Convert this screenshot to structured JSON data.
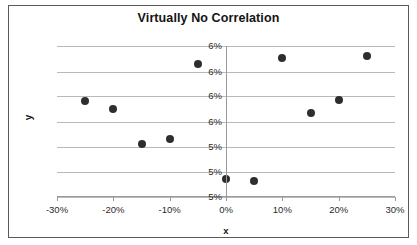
{
  "chart_data": {
    "type": "scatter",
    "title": "Virtually No Correlation",
    "xlabel": "x",
    "ylabel": "y",
    "xlim": [
      -0.3,
      0.3
    ],
    "ylim": [
      0.0505,
      0.064
    ],
    "grid": true,
    "legend": null,
    "marker_color": "#2e2e2e",
    "gridline_color": "#b9b9b9",
    "axis_color": "#9a9a9a",
    "border_color": "#5a5a5a",
    "x_tick_labels": [
      "-30%",
      "-20%",
      "-10%",
      "0%",
      "10%",
      "20%",
      "30%"
    ],
    "x_tick_values": [
      -0.3,
      -0.2,
      -0.1,
      0.0,
      0.1,
      0.2,
      0.3
    ],
    "y_tick_labels": [
      "6%",
      "6%",
      "6%",
      "6%",
      "5%",
      "5%",
      "5%"
    ],
    "y_tick_values": [
      0.064,
      0.0617,
      0.0595,
      0.0572,
      0.055,
      0.0527,
      0.0505
    ],
    "points": [
      {
        "x": -0.25,
        "y": 0.0591
      },
      {
        "x": -0.2,
        "y": 0.0584
      },
      {
        "x": -0.15,
        "y": 0.0552
      },
      {
        "x": -0.1,
        "y": 0.0557
      },
      {
        "x": -0.05,
        "y": 0.0624
      },
      {
        "x": 0.0,
        "y": 0.0521
      },
      {
        "x": 0.05,
        "y": 0.0519
      },
      {
        "x": 0.1,
        "y": 0.0629
      },
      {
        "x": 0.15,
        "y": 0.058
      },
      {
        "x": 0.2,
        "y": 0.0592
      },
      {
        "x": 0.25,
        "y": 0.0631
      }
    ]
  }
}
